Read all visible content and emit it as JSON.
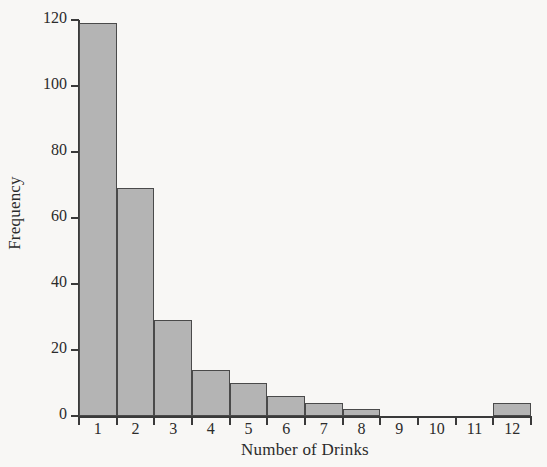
{
  "chart_data": {
    "type": "bar",
    "title": "",
    "subtitle": "",
    "xlabel": "Number of Drinks",
    "ylabel": "Frequency",
    "categories": [
      "1",
      "2",
      "3",
      "4",
      "5",
      "6",
      "7",
      "8",
      "9",
      "10",
      "11",
      "12"
    ],
    "values": [
      119,
      69,
      29,
      14,
      10,
      6,
      4,
      2,
      0,
      0,
      0,
      4
    ],
    "series": [
      {
        "name": "Frequency",
        "values": [
          119,
          69,
          29,
          14,
          10,
          6,
          4,
          2,
          0,
          0,
          0,
          4
        ]
      }
    ],
    "ylim": [
      0,
      120
    ],
    "xlim": [
      0,
      12
    ],
    "yticks": [
      0,
      20,
      40,
      60,
      80,
      100,
      120
    ],
    "ytick_labels": [
      "0",
      "20",
      "40",
      "60",
      "80",
      "100",
      "120"
    ],
    "xtick_labels": [
      "1",
      "2",
      "3",
      "4",
      "5",
      "6",
      "7",
      "8",
      "9",
      "10",
      "11",
      "12"
    ],
    "grid": false,
    "legend": "none",
    "bar_fill_color": "#b4b4b4",
    "bar_edge_color": "#4a4a4a",
    "background_color": "#f8f7f5",
    "axis_color": "#3a3a3a",
    "text_color": "#2b2b2b"
  }
}
